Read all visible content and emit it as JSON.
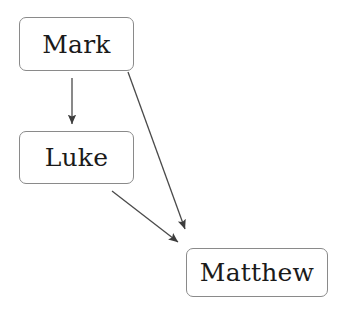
{
  "diagram": {
    "background_color": "#ffffff",
    "node_fill_color": "#ffffff",
    "node_border_color": "#8a8a8a",
    "label_color": "#1a1a1a",
    "edge_color": "#4a4a4a",
    "nodes": [
      {
        "id": "mark",
        "label": "Mark",
        "x": 19,
        "y": 17,
        "width": 115,
        "height": 54
      },
      {
        "id": "luke",
        "label": "Luke",
        "x": 19,
        "y": 131,
        "width": 115,
        "height": 53
      },
      {
        "id": "matthew",
        "label": "Matthew",
        "x": 186,
        "y": 248,
        "width": 142,
        "height": 49
      }
    ],
    "edges": [
      {
        "id": "mark-to-luke",
        "from": "mark",
        "to": "luke",
        "label": "",
        "x1": 72,
        "y1": 78,
        "x2": 72,
        "y2": 126
      },
      {
        "id": "mark-to-matthew",
        "from": "mark",
        "to": "matthew",
        "label": "",
        "x1": 128,
        "y1": 72,
        "x2": 187,
        "y2": 232
      },
      {
        "id": "luke-to-matthew",
        "from": "luke",
        "to": "matthew",
        "label": "",
        "x1": 112,
        "y1": 191,
        "x2": 181,
        "y2": 245
      }
    ]
  }
}
